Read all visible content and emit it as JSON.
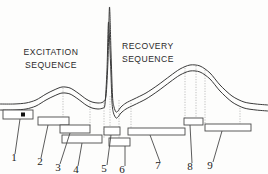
{
  "figure": {
    "type": "ecg-waveform-annotated-diagram",
    "background_color": "#fdfdfc",
    "trace_color": "#3a3a3a",
    "guide_color": "#b8b8b8",
    "bar_color": "#ffffff",
    "bar_border_color": "#4a4a4a",
    "marker_color": "#111111",
    "text_color": "#1a1a1a"
  },
  "labels": {
    "excitation": "EXCITATION\nSEQUENCE",
    "recovery": "RECOVERY\nSEQUENCE"
  },
  "callouts": [
    {
      "number": "1",
      "x": 14,
      "y": 161
    },
    {
      "number": "2",
      "x": 40,
      "y": 165
    },
    {
      "number": "3",
      "x": 58,
      "y": 171
    },
    {
      "number": "4",
      "x": 76,
      "y": 173
    },
    {
      "number": "5",
      "x": 104,
      "y": 172
    },
    {
      "number": "6",
      "x": 122,
      "y": 173
    },
    {
      "number": "7",
      "x": 158,
      "y": 169
    },
    {
      "number": "8",
      "x": 190,
      "y": 170
    },
    {
      "number": "9",
      "x": 210,
      "y": 169
    }
  ],
  "bars": [
    {
      "id": "1",
      "x": 3,
      "y": 110,
      "w": 30,
      "h": 9
    },
    {
      "id": "2",
      "x": 38,
      "y": 117,
      "w": 31,
      "h": 8
    },
    {
      "id": "3",
      "x": 60,
      "y": 125,
      "w": 30,
      "h": 8
    },
    {
      "id": "4",
      "x": 62,
      "y": 135,
      "w": 40,
      "h": 8
    },
    {
      "id": "5",
      "x": 104,
      "y": 127,
      "w": 16,
      "h": 8
    },
    {
      "id": "6",
      "x": 109,
      "y": 138,
      "w": 21,
      "h": 8
    },
    {
      "id": "7",
      "x": 128,
      "y": 128,
      "w": 57,
      "h": 7
    },
    {
      "id": "8",
      "x": 184,
      "y": 118,
      "w": 19,
      "h": 7
    },
    {
      "id": "9",
      "x": 205,
      "y": 124,
      "w": 46,
      "h": 7
    }
  ],
  "bar_marker": {
    "x": 21,
    "y": 112.5,
    "size": 4
  },
  "leaders": [
    {
      "from_x": 20,
      "from_y": 119,
      "to_x": 15,
      "to_y": 154
    },
    {
      "from_x": 48,
      "from_y": 125,
      "to_x": 41,
      "to_y": 158
    },
    {
      "from_x": 70,
      "from_y": 133,
      "to_x": 60,
      "to_y": 164
    },
    {
      "from_x": 82,
      "from_y": 143,
      "to_x": 78,
      "to_y": 166
    },
    {
      "from_x": 111,
      "from_y": 135,
      "to_x": 107,
      "to_y": 165
    },
    {
      "from_x": 125,
      "from_y": 146,
      "to_x": 125,
      "to_y": 166
    },
    {
      "from_x": 150,
      "from_y": 135,
      "to_x": 160,
      "to_y": 162
    },
    {
      "from_x": 190,
      "from_y": 125,
      "to_x": 192,
      "to_y": 163
    },
    {
      "from_x": 222,
      "from_y": 131,
      "to_x": 213,
      "to_y": 162
    }
  ],
  "guides": [
    {
      "x": 63,
      "y1": 88,
      "y2": 135
    },
    {
      "x": 90,
      "y1": 101,
      "y2": 127
    },
    {
      "x": 104,
      "y1": 100,
      "y2": 138
    },
    {
      "x": 110,
      "y1": 96,
      "y2": 146
    },
    {
      "x": 119,
      "y1": 100,
      "y2": 138
    },
    {
      "x": 131,
      "y1": 103,
      "y2": 128
    },
    {
      "x": 185,
      "y1": 68,
      "y2": 124
    },
    {
      "x": 196,
      "y1": 66,
      "y2": 118
    },
    {
      "x": 205,
      "y1": 70,
      "y2": 124
    },
    {
      "x": 240,
      "y1": 108,
      "y2": 124
    }
  ],
  "chart_data": {
    "type": "line",
    "title": "",
    "xlabel": "",
    "ylabel": "",
    "note": "Idealized ECG complex drawn as a two-line ribbon: flat baseline, P-wave bump, PR depression, tall narrow QRS spike, S trough, and a broad T-wave, ending on a flat baseline.",
    "series": [
      {
        "name": "upper-trace",
        "points": [
          [
            0,
            104
          ],
          [
            14,
            104
          ],
          [
            26,
            103
          ],
          [
            36,
            100
          ],
          [
            46,
            94
          ],
          [
            54,
            90
          ],
          [
            62,
            87
          ],
          [
            70,
            88
          ],
          [
            78,
            93
          ],
          [
            86,
            99
          ],
          [
            92,
            102
          ],
          [
            98,
            103
          ],
          [
            103,
            102
          ],
          [
            106,
            96
          ],
          [
            108,
            60
          ],
          [
            109.5,
            7
          ],
          [
            111,
            52
          ],
          [
            112.5,
            96
          ],
          [
            114,
            107
          ],
          [
            116,
            112
          ],
          [
            118,
            111
          ],
          [
            121,
            107
          ],
          [
            126,
            103
          ],
          [
            134,
            99
          ],
          [
            146,
            93
          ],
          [
            158,
            85
          ],
          [
            170,
            76
          ],
          [
            180,
            69
          ],
          [
            190,
            65
          ],
          [
            200,
            66
          ],
          [
            210,
            73
          ],
          [
            220,
            85
          ],
          [
            232,
            96
          ],
          [
            244,
            102
          ],
          [
            256,
            104
          ],
          [
            268,
            105
          ]
        ]
      },
      {
        "name": "lower-trace",
        "points": [
          [
            0,
            110
          ],
          [
            14,
            110
          ],
          [
            26,
            109
          ],
          [
            36,
            106
          ],
          [
            46,
            100
          ],
          [
            54,
            96
          ],
          [
            62,
            93
          ],
          [
            70,
            94
          ],
          [
            78,
            99
          ],
          [
            86,
            105
          ],
          [
            92,
            108
          ],
          [
            98,
            109
          ],
          [
            103,
            108
          ],
          [
            105,
            104
          ],
          [
            107,
            70
          ],
          [
            108.5,
            22
          ],
          [
            110.5,
            62
          ],
          [
            112,
            102
          ],
          [
            113.5,
            113
          ],
          [
            116,
            118
          ],
          [
            118,
            117
          ],
          [
            121,
            113
          ],
          [
            126,
            109
          ],
          [
            134,
            105
          ],
          [
            146,
            99
          ],
          [
            158,
            91
          ],
          [
            170,
            82
          ],
          [
            180,
            75
          ],
          [
            190,
            71
          ],
          [
            200,
            72
          ],
          [
            210,
            79
          ],
          [
            220,
            91
          ],
          [
            232,
            102
          ],
          [
            244,
            108
          ],
          [
            256,
            110
          ],
          [
            268,
            111
          ]
        ]
      }
    ],
    "features": [
      {
        "name": "P-wave-peak",
        "x": 63,
        "y": 88
      },
      {
        "name": "QRS-spike-peak",
        "x": 110,
        "y": 7
      },
      {
        "name": "S-trough",
        "x": 117,
        "y": 112
      },
      {
        "name": "T-wave-peak",
        "x": 195,
        "y": 65
      }
    ]
  }
}
